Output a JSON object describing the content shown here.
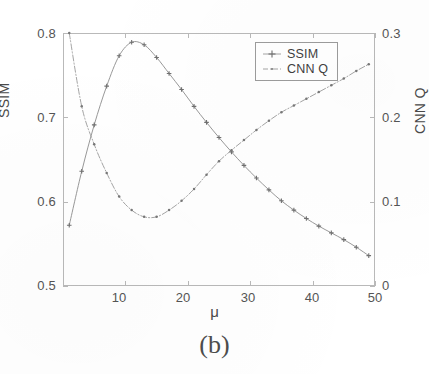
{
  "figure": {
    "caption": "(b)"
  },
  "axes": {
    "xlabel": "μ",
    "ylabel_left": "SSIM",
    "ylabel_right": "CNN Q",
    "x_ticks": [
      "10",
      "20",
      "30",
      "40",
      "50"
    ],
    "y_ticks_left": [
      "0.5",
      "0.6",
      "0.7",
      "0.8"
    ],
    "y_ticks_right": [
      "0",
      "0.1",
      "0.2",
      "0.3"
    ]
  },
  "legend": {
    "entries": [
      {
        "label": "SSIM",
        "marker": "plus-marker",
        "style": "solid-line",
        "color": "#8d8d8d"
      },
      {
        "label": "CNN Q",
        "marker": "dot-marker",
        "style": "dash-dot-line",
        "color": "#9a9a9a"
      }
    ]
  },
  "chart_data": {
    "type": "line",
    "title": "",
    "subtitle": "",
    "xlabel": "μ",
    "ylabel": "SSIM",
    "ylabel_secondary": "CNN Q",
    "xlim": [
      0,
      50
    ],
    "ylim": [
      0.5,
      0.8
    ],
    "ylim_secondary": [
      0,
      0.3
    ],
    "grid": false,
    "legend_position": "top-right",
    "annotations": [
      "(b)"
    ],
    "x": [
      1,
      3,
      5,
      7,
      9,
      11,
      13,
      15,
      17,
      19,
      21,
      23,
      25,
      27,
      29,
      31,
      33,
      35,
      37,
      39,
      41,
      43,
      45,
      47,
      49
    ],
    "series": [
      {
        "name": "SSIM",
        "axis": "left",
        "color": "#8d8d8d",
        "marker": "plus",
        "linestyle": "solid",
        "values": [
          0.572,
          0.636,
          0.691,
          0.737,
          0.773,
          0.789,
          0.786,
          0.771,
          0.752,
          0.733,
          0.713,
          0.694,
          0.676,
          0.659,
          0.643,
          0.628,
          0.614,
          0.601,
          0.59,
          0.58,
          0.571,
          0.563,
          0.555,
          0.546,
          0.536
        ]
      },
      {
        "name": "CNN Q",
        "axis": "right",
        "color": "#9a9a9a",
        "marker": "dot",
        "linestyle": "dashdot",
        "values": [
          0.3,
          0.213,
          0.168,
          0.134,
          0.106,
          0.09,
          0.082,
          0.082,
          0.09,
          0.101,
          0.115,
          0.132,
          0.148,
          0.161,
          0.173,
          0.185,
          0.196,
          0.206,
          0.214,
          0.222,
          0.23,
          0.238,
          0.246,
          0.255,
          0.263
        ]
      }
    ]
  }
}
